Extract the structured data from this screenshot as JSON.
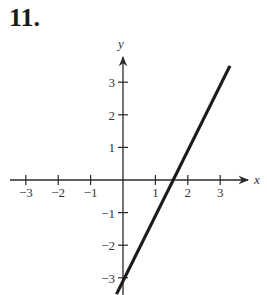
{
  "problem": {
    "number": "11."
  },
  "chart_data": {
    "type": "line",
    "title": "",
    "xlabel": "x",
    "ylabel": "y",
    "xlim": [
      -3.3,
      3.8
    ],
    "ylim": [
      -3.5,
      3.8
    ],
    "grid": false,
    "x_ticks": [
      -3,
      -2,
      -1,
      1,
      2,
      3
    ],
    "y_ticks": [
      -3,
      -2,
      -1,
      1,
      2,
      3
    ],
    "x_tick_labels": [
      "−3",
      "−2",
      "−1",
      "1",
      "2",
      "3"
    ],
    "y_tick_labels": [
      "−3",
      "−2",
      "−1",
      "1",
      "2",
      "3"
    ],
    "series": [
      {
        "name": "line",
        "equation": "y = 2x − 3",
        "x": [
          -0.2,
          3.3
        ],
        "y": [
          -3.5,
          3.5
        ],
        "color": "#1a1a1a"
      }
    ],
    "intercepts": {
      "x": 1.5,
      "y": -3
    }
  }
}
